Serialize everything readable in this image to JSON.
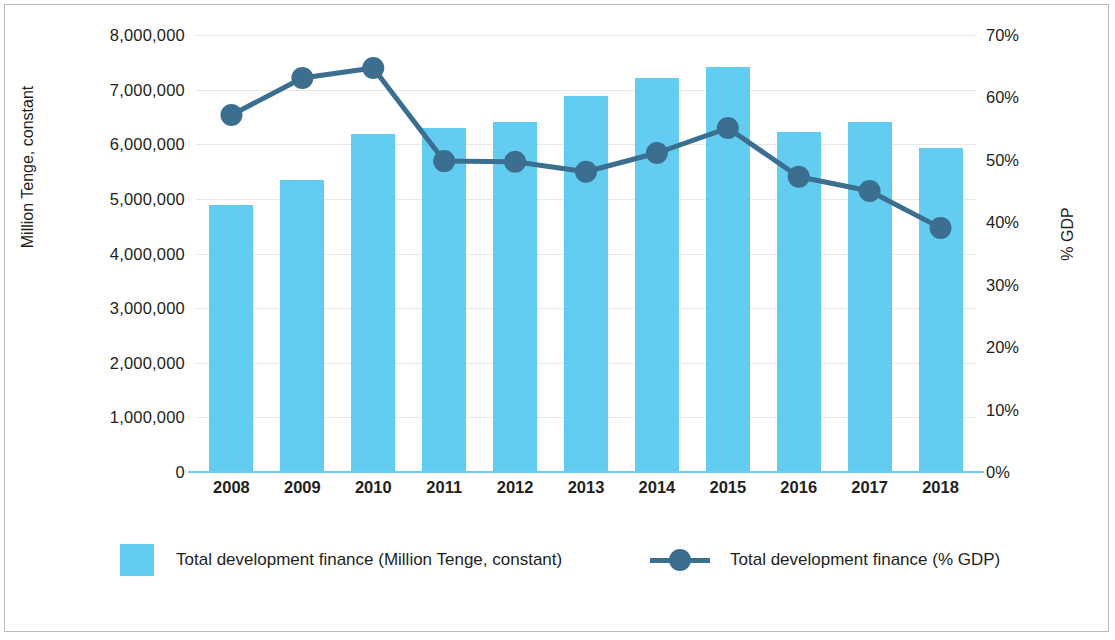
{
  "chart_data": {
    "type": "bar",
    "title": "",
    "subtitle": "",
    "categories": [
      "2008",
      "2009",
      "2010",
      "2011",
      "2012",
      "2013",
      "2014",
      "2015",
      "2016",
      "2017",
      "2018"
    ],
    "xlabel": "",
    "ylabel": "Million Tenge, constant",
    "y2label": "% GDP",
    "ylim": [
      0,
      8000000
    ],
    "y2lim": [
      0,
      70
    ],
    "yticks": [
      "0",
      "1,000,000",
      "2,000,000",
      "3,000,000",
      "4,000,000",
      "5,000,000",
      "6,000,000",
      "7,000,000",
      "8,000,000"
    ],
    "ytick_values": [
      0,
      1000000,
      2000000,
      3000000,
      4000000,
      5000000,
      6000000,
      7000000,
      8000000
    ],
    "y2ticks": [
      "0%",
      "10%",
      "20%",
      "30%",
      "40%",
      "50%",
      "60%",
      "70%"
    ],
    "y2tick_values": [
      0,
      10,
      20,
      30,
      40,
      50,
      60,
      70
    ],
    "grid": true,
    "legend_position": "bottom",
    "series": [
      {
        "name": "Total development finance (Million Tenge, constant)",
        "type": "bar",
        "axis": "left",
        "color": "#63cdf1",
        "values": [
          4890000,
          5350000,
          6190000,
          6300000,
          6410000,
          6890000,
          7210000,
          7420000,
          6230000,
          6410000,
          5940000
        ]
      },
      {
        "name": "Total development finance (% GDP)",
        "type": "line",
        "axis": "right",
        "color": "#3b6e8f",
        "values": [
          57.2,
          63.1,
          64.7,
          49.8,
          49.7,
          48.1,
          51.1,
          55.1,
          47.3,
          45.0,
          39.1
        ]
      }
    ]
  },
  "legend": {
    "bar_label": "Total development finance (Million Tenge, constant)",
    "line_label": "Total development finance (% GDP)"
  },
  "colors": {
    "bar": "#63cdf1",
    "line": "#3b6e8f",
    "grid": "#e8e8e8",
    "text": "#231f20"
  }
}
